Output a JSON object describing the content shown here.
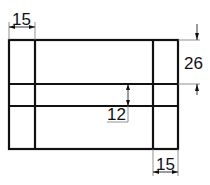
{
  "diagram": {
    "type": "technical-drawing",
    "colors": {
      "line": "#111111",
      "extension": "#777777",
      "background": "#ffffff"
    },
    "dimensions": {
      "top_width": "15",
      "right_height": "26",
      "center_gap": "12",
      "bottom_width": "15"
    }
  }
}
